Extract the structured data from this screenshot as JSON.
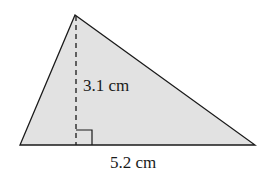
{
  "diagram": {
    "shape": "triangle",
    "fill_color": "#e2e2e2",
    "stroke_color": "#1a1a1a",
    "height_label": "3.1 cm",
    "base_label": "5.2 cm"
  }
}
